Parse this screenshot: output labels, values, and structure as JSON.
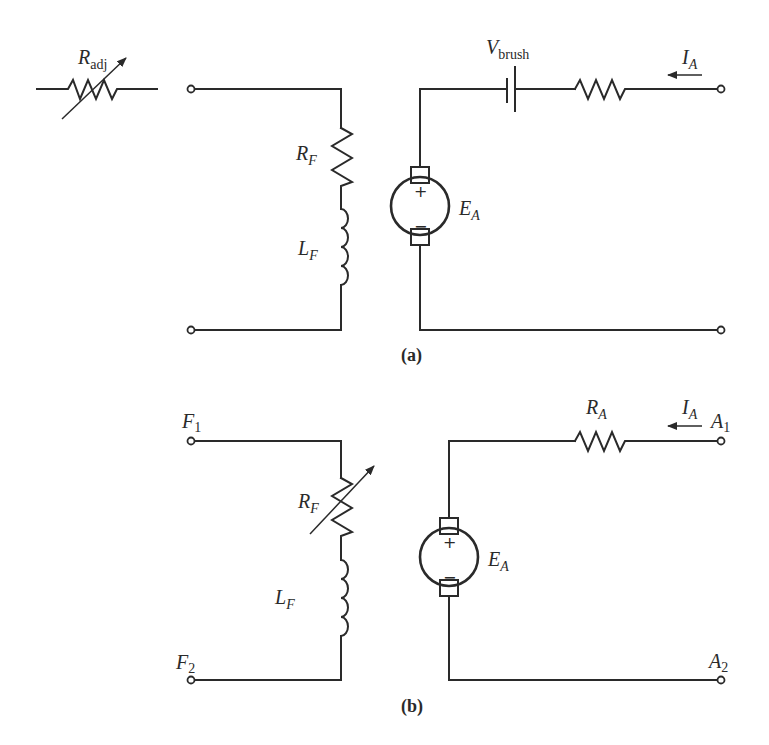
{
  "figure": {
    "panel_a": {
      "caption": "(a)",
      "adjustable_resistor": {
        "symbol": "R",
        "subscript": "adj"
      },
      "field_resistor": {
        "symbol": "R",
        "subscript": "F"
      },
      "field_inductor": {
        "symbol": "L",
        "subscript": "F"
      },
      "brush_drop": {
        "symbol": "V",
        "subscript": "brush"
      },
      "armature_emf": {
        "symbol": "E",
        "subscript": "A",
        "plus": "+",
        "minus": "−"
      },
      "armature_current": {
        "symbol": "I",
        "subscript": "A"
      }
    },
    "panel_b": {
      "caption": "(b)",
      "terminals": {
        "f1": {
          "symbol": "F",
          "subscript": "1"
        },
        "f2": {
          "symbol": "F",
          "subscript": "2"
        },
        "a1": {
          "symbol": "A",
          "subscript": "1"
        },
        "a2": {
          "symbol": "A",
          "subscript": "2"
        }
      },
      "field_resistor": {
        "symbol": "R",
        "subscript": "F"
      },
      "field_inductor": {
        "symbol": "L",
        "subscript": "F"
      },
      "armature_resistor": {
        "symbol": "R",
        "subscript": "A"
      },
      "armature_emf": {
        "symbol": "E",
        "subscript": "A",
        "plus": "+",
        "minus": "−"
      },
      "armature_current": {
        "symbol": "I",
        "subscript": "A"
      }
    }
  }
}
